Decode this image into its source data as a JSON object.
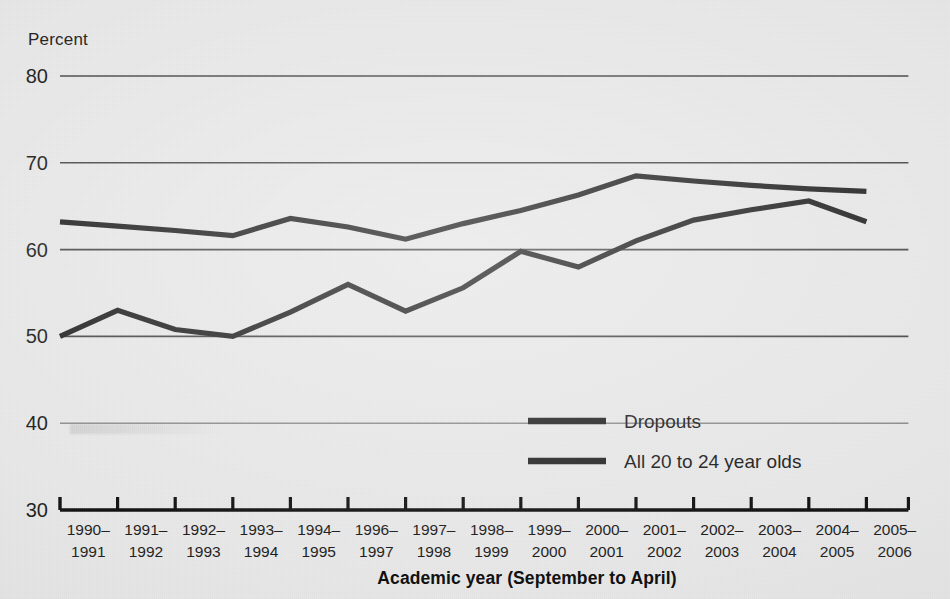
{
  "chart_data": {
    "type": "line",
    "title": "",
    "xlabel": "Academic year (September to April)",
    "ylabel": "Percent",
    "ylim": [
      30,
      80
    ],
    "yticks": [
      30,
      40,
      50,
      60,
      70,
      80
    ],
    "grid": true,
    "legend_position": "inside-lower-right",
    "categories": [
      "1990–\n1991",
      "1991–\n1992",
      "1992–\n1993",
      "1993–\n1994",
      "1994–\n1995",
      "1996–\n1997",
      "1997–\n1998",
      "1998–\n1999",
      "1999–\n2000",
      "2000–\n2001",
      "2001–\n2002",
      "2002–\n2003",
      "2003–\n2004",
      "2004–\n2005",
      "2005–\n2006"
    ],
    "categories_line1": [
      "1990–",
      "1991–",
      "1992–",
      "1993–",
      "1994–",
      "1996–",
      "1997–",
      "1998–",
      "1999–",
      "2000–",
      "2001–",
      "2002–",
      "2003–",
      "2004–",
      "2005–"
    ],
    "categories_line2": [
      "1991",
      "1992",
      "1993",
      "1994",
      "1995",
      "1997",
      "1998",
      "1999",
      "2000",
      "2001",
      "2002",
      "2003",
      "2004",
      "2005",
      "2006"
    ],
    "series": [
      {
        "name": "All 20 to 24 year olds",
        "values": [
          63.2,
          62.7,
          62.2,
          61.6,
          63.6,
          62.6,
          61.2,
          63.0,
          64.5,
          66.3,
          68.5,
          67.9,
          67.4,
          67.0,
          66.7
        ]
      },
      {
        "name": "Dropouts",
        "values": [
          50.0,
          53.0,
          50.8,
          50.0,
          52.8,
          56.0,
          52.9,
          55.6,
          59.8,
          58.0,
          61.0,
          63.4,
          64.6,
          65.6,
          63.2
        ]
      }
    ]
  },
  "legend": {
    "entries": [
      {
        "label": "Dropouts"
      },
      {
        "label": "All 20 to 24 year olds"
      }
    ]
  },
  "axis": {
    "y_title": "Percent",
    "x_title": "Academic year (September to April)"
  }
}
